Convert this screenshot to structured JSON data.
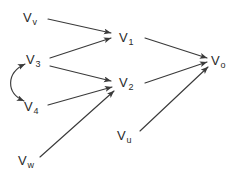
{
  "diagram": {
    "type": "directed-graph",
    "background_color": "#ffffff",
    "edge_color": "#3a3a3a",
    "label_color": "#2b2b2b",
    "width": 246,
    "height": 182,
    "nodes": [
      {
        "id": "Vv",
        "base": "V",
        "sub": "v",
        "label": "Vv",
        "x": 30,
        "y": 18
      },
      {
        "id": "V3",
        "base": "V",
        "sub": "3",
        "label": "V3",
        "x": 30,
        "y": 60
      },
      {
        "id": "V4",
        "base": "V",
        "sub": "4",
        "label": "V4",
        "x": 28,
        "y": 107
      },
      {
        "id": "Vw",
        "base": "V",
        "sub": "w",
        "label": "Vw",
        "x": 24,
        "y": 161
      },
      {
        "id": "V1",
        "base": "V",
        "sub": "1",
        "label": "V1",
        "x": 124,
        "y": 40
      },
      {
        "id": "V2",
        "base": "V",
        "sub": "2",
        "label": "V2",
        "x": 124,
        "y": 86
      },
      {
        "id": "Vu",
        "base": "V",
        "sub": "u",
        "label": "Vu",
        "x": 122,
        "y": 136
      },
      {
        "id": "Vo",
        "base": "V",
        "sub": "o",
        "label": "Vo",
        "x": 218,
        "y": 62
      }
    ],
    "edges": [
      {
        "from": "Vv",
        "to": "V1",
        "kind": "directed",
        "x1": 48,
        "y1": 19,
        "x2": 113,
        "y2": 33
      },
      {
        "from": "V3",
        "to": "V1",
        "kind": "directed",
        "x1": 50,
        "y1": 58,
        "x2": 113,
        "y2": 37
      },
      {
        "from": "V3",
        "to": "V2",
        "kind": "directed",
        "x1": 50,
        "y1": 65,
        "x2": 113,
        "y2": 82
      },
      {
        "from": "V4",
        "to": "V2",
        "kind": "directed",
        "x1": 47,
        "y1": 105,
        "x2": 113,
        "y2": 86
      },
      {
        "from": "Vw",
        "to": "V2",
        "kind": "directed",
        "x1": 40,
        "y1": 158,
        "x2": 115,
        "y2": 90
      },
      {
        "from": "V1",
        "to": "Vo",
        "kind": "directed",
        "x1": 142,
        "y1": 38,
        "x2": 207,
        "y2": 58
      },
      {
        "from": "V2",
        "to": "Vo",
        "kind": "directed",
        "x1": 142,
        "y1": 82,
        "x2": 207,
        "y2": 61
      },
      {
        "from": "Vu",
        "to": "Vo",
        "kind": "directed",
        "x1": 138,
        "y1": 131,
        "x2": 208,
        "y2": 66
      },
      {
        "from": "V3",
        "to": "V4",
        "kind": "bidirected",
        "x1": 24,
        "y1": 62,
        "x2": 23,
        "y2": 101,
        "cx1": 4,
        "cy1": 72,
        "cx2": 4,
        "cy2": 92
      }
    ]
  }
}
